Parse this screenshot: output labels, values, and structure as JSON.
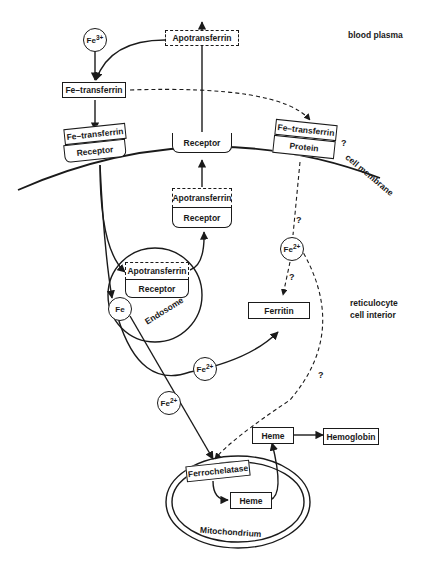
{
  "diagram": {
    "regions": {
      "plasma": "blood plasma",
      "membrane": "cell membrane",
      "interior_line1": "reticulocyte",
      "interior_line2": "cell interior"
    },
    "nodes": {
      "fe3": {
        "base": "Fe",
        "sup": "3+"
      },
      "apotransferrin_plasma": "Apotransferrin",
      "fe_transferrin_plasma": "Fe–transferrin",
      "membrane_fe_transferrin": "Fe–transferrin",
      "membrane_receptor": "Receptor",
      "membrane_receptor_mid": "Receptor",
      "membrane_fe_transferrin_right": "Fe–transferrin",
      "membrane_protein": "Protein",
      "recycle_apotransferrin": "Apotransferrin",
      "recycle_receptor": "Receptor",
      "endosome_apotransferrin": "Apotransferrin",
      "endosome_receptor": "Receptor",
      "endosome_label": "Endosome",
      "fe": "Fe",
      "fe2_top": {
        "base": "Fe",
        "sup": "2+"
      },
      "fe2_mid": {
        "base": "Fe",
        "sup": "2+"
      },
      "fe2_low": {
        "base": "Fe",
        "sup": "2+"
      },
      "ferritin": "Ferritin",
      "ferrochelatase": "Ferrochelatase",
      "heme_inner": "Heme",
      "heme_outer": "Heme",
      "hemoglobin": "Hemoglobin",
      "mitochondrion": "Mitochondrium"
    },
    "question_marks": [
      "?",
      "?",
      "?",
      "?"
    ]
  }
}
